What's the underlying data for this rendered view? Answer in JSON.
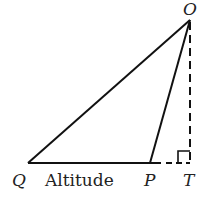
{
  "diagram": {
    "type": "geometry-triangle",
    "points": {
      "O": {
        "label": "O",
        "x": 190,
        "y": 20
      },
      "Q": {
        "label": "Q",
        "x": 28,
        "y": 163
      },
      "P": {
        "label": "P",
        "x": 150,
        "y": 163
      },
      "T": {
        "label": "T",
        "x": 190,
        "y": 163
      }
    },
    "segments": [
      {
        "from": "Q",
        "to": "O",
        "style": "solid"
      },
      {
        "from": "P",
        "to": "O",
        "style": "solid"
      },
      {
        "from": "Q",
        "to": "P",
        "style": "solid"
      },
      {
        "from": "P",
        "to": "T",
        "style": "dashed"
      },
      {
        "from": "O",
        "to": "T",
        "style": "dashed"
      }
    ],
    "right_angle_at": "T",
    "base_label": "Altitude",
    "colors": {
      "stroke": "#111111",
      "text": "#222222"
    }
  }
}
